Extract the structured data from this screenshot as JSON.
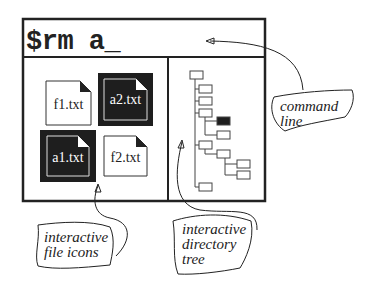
{
  "command_line": {
    "text": "$rm a_"
  },
  "files": [
    {
      "name": "f1.txt",
      "selected": false
    },
    {
      "name": "a2.txt",
      "selected": true
    },
    {
      "name": "a1.txt",
      "selected": true
    },
    {
      "name": "f2.txt",
      "selected": false
    }
  ],
  "annotations": {
    "command_line": "command line",
    "file_icons": "interactive file icons",
    "directory_tree": "interactive directory tree"
  },
  "colors": {
    "ink": "#222222",
    "selected_fill": "#1e1e1e",
    "background": "#ffffff"
  }
}
